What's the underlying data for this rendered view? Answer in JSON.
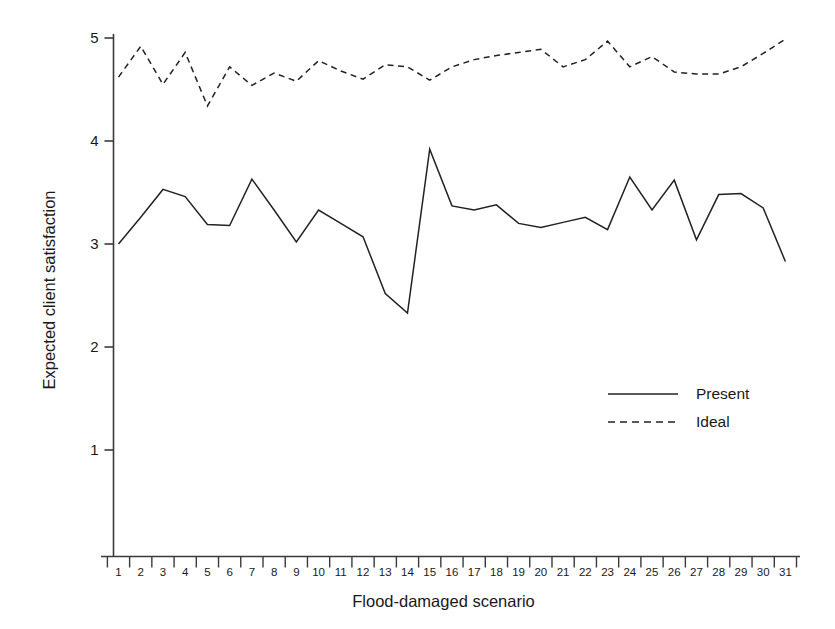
{
  "chart_data": {
    "type": "line",
    "title": "",
    "xlabel": "Flood-damaged scenario",
    "ylabel": "Expected client satisfaction",
    "x": [
      1,
      2,
      3,
      4,
      5,
      6,
      7,
      8,
      9,
      10,
      11,
      12,
      13,
      14,
      15,
      16,
      17,
      18,
      19,
      20,
      21,
      22,
      23,
      24,
      25,
      26,
      27,
      28,
      29,
      30,
      31
    ],
    "xticklabels": [
      "1",
      "2",
      "3",
      "4",
      "5",
      "6",
      "7",
      "8",
      "9",
      "10",
      "11",
      "12",
      "13",
      "14",
      "15",
      "16",
      "17",
      "18",
      "19",
      "20",
      "21",
      "22",
      "23",
      "24",
      "25",
      "26",
      "27",
      "28",
      "29",
      "30",
      "31"
    ],
    "yticklabels": [
      "1",
      "2",
      "3",
      "4",
      "5"
    ],
    "yticks": [
      1,
      2,
      3,
      4,
      5
    ],
    "ylim": [
      0.55,
      5.15
    ],
    "xlim": [
      0.45,
      31.55
    ],
    "grid": false,
    "legend_position": "center-right",
    "series": [
      {
        "name": "Present",
        "style": "solid",
        "color": "#222222",
        "values": [
          3.0,
          3.26,
          3.53,
          3.46,
          3.19,
          3.18,
          3.63,
          3.33,
          3.02,
          3.33,
          3.2,
          3.07,
          2.52,
          2.33,
          3.92,
          3.37,
          3.33,
          3.38,
          3.2,
          3.16,
          3.21,
          3.26,
          3.14,
          3.65,
          3.33,
          3.62,
          3.04,
          3.48,
          3.49,
          3.35,
          2.83
        ]
      },
      {
        "name": "Ideal",
        "style": "dashed",
        "color": "#222222",
        "values": [
          4.62,
          4.92,
          4.55,
          4.86,
          4.34,
          4.72,
          4.54,
          4.66,
          4.58,
          4.78,
          4.68,
          4.6,
          4.74,
          4.72,
          4.59,
          4.72,
          4.79,
          4.83,
          4.86,
          4.89,
          4.72,
          4.79,
          4.97,
          4.72,
          4.82,
          4.67,
          4.65,
          4.65,
          4.72,
          4.85,
          4.99
        ]
      }
    ]
  },
  "legend": {
    "items": [
      {
        "label": "Present",
        "style": "solid"
      },
      {
        "label": "Ideal",
        "style": "dashed"
      }
    ]
  },
  "axes": {
    "y_title": "Expected client satisfaction",
    "x_title": "Flood-damaged scenario"
  },
  "colors": {
    "line": "#222222",
    "axis": "#3a3a3a",
    "text": "#191919",
    "background": "#ffffff"
  }
}
